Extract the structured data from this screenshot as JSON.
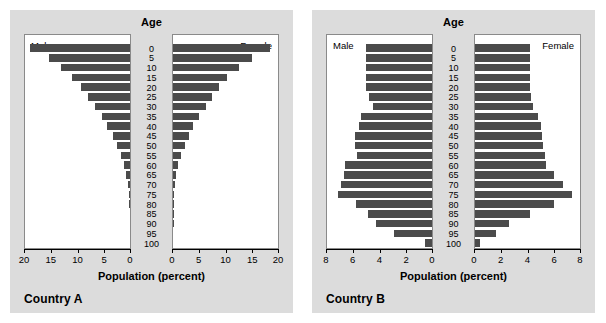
{
  "figure": {
    "background": "#ffffff",
    "panel_background": "#dcdcdc",
    "bar_color": "#4b4b4b",
    "plot_background": "#ffffff"
  },
  "panels": [
    {
      "caption": "Country A",
      "age_header": "Age",
      "male_label": "Male",
      "female_label": "Female",
      "axis_title": "Population (percent)",
      "tick_labels_left": [
        "20",
        "15",
        "10",
        "5",
        "0"
      ],
      "tick_labels_right": [
        "0",
        "5",
        "10",
        "15",
        "20"
      ],
      "age_labels": [
        "0",
        "5",
        "10",
        "15",
        "20",
        "25",
        "30",
        "35",
        "40",
        "45",
        "50",
        "55",
        "60",
        "65",
        "70",
        "75",
        "80",
        "85",
        "90",
        "95",
        "100"
      ]
    },
    {
      "caption": "Country B",
      "age_header": "Age",
      "male_label": "Male",
      "female_label": "Female",
      "axis_title": "Population (percent)",
      "tick_labels_left": [
        "8",
        "6",
        "4",
        "2",
        "0"
      ],
      "tick_labels_right": [
        "0",
        "2",
        "4",
        "6",
        "8"
      ],
      "age_labels": [
        "0",
        "5",
        "10",
        "15",
        "20",
        "25",
        "30",
        "35",
        "40",
        "45",
        "50",
        "55",
        "60",
        "65",
        "70",
        "75",
        "80",
        "85",
        "90",
        "95",
        "100"
      ]
    }
  ],
  "chart_data": [
    {
      "type": "bar",
      "title": "Country A",
      "subtitle": "Age",
      "xlabel": "Population (percent)",
      "ylabel": "Age",
      "orientation": "horizontal",
      "layout": "population-pyramid",
      "xlim_left": [
        20,
        0
      ],
      "xlim_right": [
        0,
        20
      ],
      "xticks_left": [
        20,
        15,
        10,
        5,
        0
      ],
      "xticks_right": [
        0,
        5,
        10,
        15,
        20
      ],
      "grid": false,
      "legend": [
        "Male",
        "Female"
      ],
      "legend_position": "inside-top-corners",
      "categories": [
        "0",
        "5",
        "10",
        "15",
        "20",
        "25",
        "30",
        "35",
        "40",
        "45",
        "50",
        "55",
        "60",
        "65",
        "70",
        "75",
        "80",
        "85",
        "90",
        "95",
        "100"
      ],
      "series": [
        {
          "name": "Male",
          "values": [
            19.0,
            15.4,
            13.1,
            11.0,
            9.4,
            8.0,
            6.6,
            5.4,
            4.3,
            3.3,
            2.4,
            1.7,
            1.1,
            0.7,
            0.4,
            0.2,
            0.1,
            0.05,
            0.02,
            0.0,
            0.0
          ]
        },
        {
          "name": "Female",
          "values": [
            18.5,
            15.1,
            12.6,
            10.2,
            8.8,
            7.4,
            6.2,
            4.9,
            3.9,
            3.0,
            2.2,
            1.5,
            1.0,
            0.6,
            0.35,
            0.2,
            0.1,
            0.05,
            0.02,
            0.0,
            0.0
          ]
        }
      ]
    },
    {
      "type": "bar",
      "title": "Country B",
      "subtitle": "Age",
      "xlabel": "Population (percent)",
      "ylabel": "Age",
      "orientation": "horizontal",
      "layout": "population-pyramid",
      "xlim_left": [
        8,
        0
      ],
      "xlim_right": [
        0,
        8
      ],
      "xticks_left": [
        8,
        6,
        4,
        2,
        0
      ],
      "xticks_right": [
        0,
        2,
        4,
        6,
        8
      ],
      "grid": false,
      "legend": [
        "Male",
        "Female"
      ],
      "legend_position": "inside-top-corners",
      "categories": [
        "0",
        "5",
        "10",
        "15",
        "20",
        "25",
        "30",
        "35",
        "40",
        "45",
        "50",
        "55",
        "60",
        "65",
        "70",
        "75",
        "80",
        "85",
        "90",
        "95",
        "100"
      ],
      "series": [
        {
          "name": "Male",
          "values": [
            5.0,
            5.0,
            5.0,
            5.0,
            5.0,
            4.8,
            4.5,
            5.4,
            5.6,
            5.9,
            5.9,
            5.7,
            6.6,
            6.7,
            6.9,
            7.2,
            5.8,
            4.9,
            4.3,
            2.9,
            0.5
          ]
        },
        {
          "name": "Female",
          "values": [
            4.2,
            4.2,
            4.2,
            4.2,
            4.2,
            4.3,
            4.4,
            4.8,
            5.0,
            5.1,
            5.2,
            5.3,
            5.4,
            6.0,
            6.7,
            7.4,
            6.0,
            4.2,
            2.6,
            1.6,
            0.4
          ]
        }
      ]
    }
  ]
}
